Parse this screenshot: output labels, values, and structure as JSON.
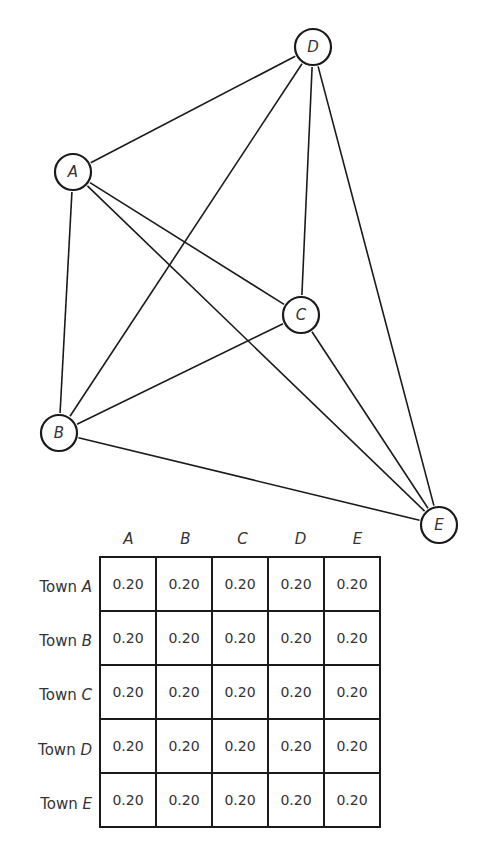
{
  "diagram": {
    "type": "complete-graph",
    "nodes": [
      {
        "id": "A",
        "label": "A",
        "x": 73,
        "y": 172
      },
      {
        "id": "B",
        "label": "B",
        "x": 59,
        "y": 433
      },
      {
        "id": "C",
        "label": "C",
        "x": 301,
        "y": 315
      },
      {
        "id": "D",
        "label": "D",
        "x": 313,
        "y": 47
      },
      {
        "id": "E",
        "label": "E",
        "x": 439,
        "y": 525
      }
    ],
    "edges": [
      [
        "A",
        "B"
      ],
      [
        "A",
        "C"
      ],
      [
        "A",
        "D"
      ],
      [
        "A",
        "E"
      ],
      [
        "B",
        "C"
      ],
      [
        "B",
        "D"
      ],
      [
        "B",
        "E"
      ],
      [
        "C",
        "D"
      ],
      [
        "C",
        "E"
      ],
      [
        "D",
        "E"
      ]
    ]
  },
  "table": {
    "columns": [
      "A",
      "B",
      "C",
      "D",
      "E"
    ],
    "rows": [
      {
        "town_prefix": "Town",
        "town": "A",
        "values": [
          "0.20",
          "0.20",
          "0.20",
          "0.20",
          "0.20"
        ]
      },
      {
        "town_prefix": "Town",
        "town": "B",
        "values": [
          "0.20",
          "0.20",
          "0.20",
          "0.20",
          "0.20"
        ]
      },
      {
        "town_prefix": "Town",
        "town": "C",
        "values": [
          "0.20",
          "0.20",
          "0.20",
          "0.20",
          "0.20"
        ]
      },
      {
        "town_prefix": "Town",
        "town": "D",
        "values": [
          "0.20",
          "0.20",
          "0.20",
          "0.20",
          "0.20"
        ]
      },
      {
        "town_prefix": "Town",
        "town": "E",
        "values": [
          "0.20",
          "0.20",
          "0.20",
          "0.20",
          "0.20"
        ]
      }
    ]
  }
}
